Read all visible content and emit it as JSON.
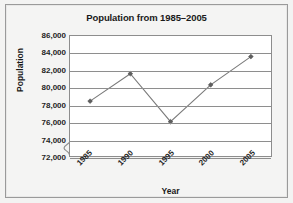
{
  "figure": {
    "background_color": "#f3f3f2",
    "frame_border_color": "#9a9a9a"
  },
  "chart_data": {
    "type": "line",
    "title": "Population from 1985–2005",
    "xlabel": "Year",
    "ylabel": "Population",
    "categories": [
      "1985",
      "1990",
      "1995",
      "2000",
      "2005"
    ],
    "values": [
      78400,
      81600,
      76000,
      80300,
      83600
    ],
    "series": [
      {
        "name": "Population",
        "values": [
          78400,
          81600,
          76000,
          80300,
          83600
        ]
      }
    ],
    "ylim": [
      72000,
      86000
    ],
    "ytick_values": [
      72000,
      74000,
      76000,
      78000,
      80000,
      82000,
      84000,
      86000
    ],
    "ytick_labels": [
      "72,000",
      "74,000",
      "76,000",
      "78,000",
      "80,000",
      "82,000",
      "84,000",
      "86,000"
    ],
    "xtick_labels": [
      "1985",
      "1990",
      "1995",
      "2000",
      "2005"
    ],
    "xtick_rotation_deg": -45,
    "grid": "horizontal",
    "grid_color": "#8e8e8e",
    "legend": "none",
    "axis_break": true,
    "axis_break_note": "y-axis broken below 72,000",
    "line_color": "#7a7a7a",
    "marker_color": "#5f5f5f",
    "marker_shape": "diamond",
    "plot_background": "#ffffff",
    "axis_color": "#8d8d8d"
  }
}
